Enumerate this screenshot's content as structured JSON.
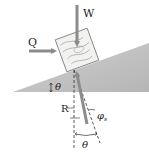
{
  "diagram": {
    "labels": {
      "weight": "W",
      "horizontal_force": "Q",
      "incline_angle": "θ",
      "reaction": "R",
      "friction_angle": "φ",
      "friction_angle_subscript": "s",
      "bottom_angle": "θ"
    },
    "colors": {
      "incline_fill": "#bdbdbd",
      "arrow": "#8c8c8c",
      "block_fill": "#f2f2f0",
      "block_grain": "#9a9a9a",
      "dashed_line": "#333333",
      "text": "#222222"
    }
  }
}
